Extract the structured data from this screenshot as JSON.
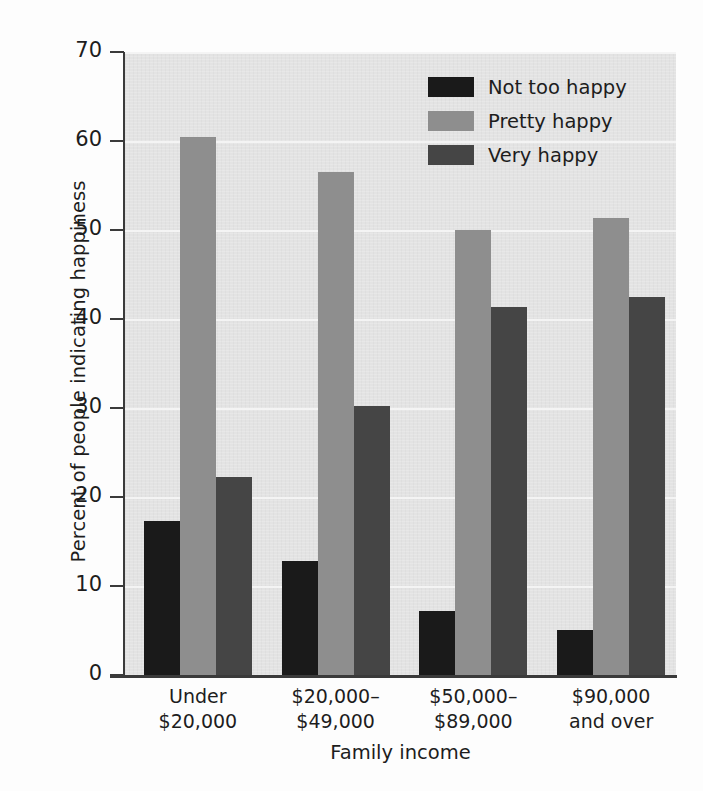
{
  "chart_data": {
    "type": "bar",
    "title": "",
    "xlabel": "Family income",
    "ylabel": "Percent of people indicating happiness",
    "categories": [
      "Under\n$20,000",
      "$20,000–\n$49,000",
      "$50,000–\n$89,000",
      "$90,000\nand over"
    ],
    "category_lines": [
      [
        "Under",
        "$20,000"
      ],
      [
        "$20,000–",
        "$49,000"
      ],
      [
        "$50,000–",
        "$89,000"
      ],
      [
        "$90,000",
        "and over"
      ]
    ],
    "series": [
      {
        "name": "Not too happy",
        "color": "#1a1a1a",
        "values": [
          17.3,
          12.8,
          7.2,
          5.1
        ]
      },
      {
        "name": "Pretty happy",
        "color": "#8e8e8e",
        "values": [
          60.4,
          56.5,
          50.0,
          51.4
        ]
      },
      {
        "name": "Very happy",
        "color": "#454545",
        "values": [
          22.2,
          30.2,
          41.4,
          42.5
        ]
      }
    ],
    "ylim": [
      0,
      70
    ],
    "yticks": [
      0,
      10,
      20,
      30,
      40,
      50,
      60,
      70
    ],
    "ytick_labels": [
      "0",
      "10",
      "20",
      "30",
      "40",
      "50",
      "60",
      "70"
    ],
    "grid": true,
    "grid_axis": "y",
    "legend_position": "upper right",
    "plot_background": "#e3e3e3",
    "gridline_color": "#f4f4f4",
    "axis_color": "#3a3a3a"
  },
  "legend": {
    "entries": [
      {
        "label": "Not too happy",
        "swatch": "legend-swatch-black"
      },
      {
        "label": "Pretty happy",
        "swatch": "legend-swatch-gray"
      },
      {
        "label": "Very happy",
        "swatch": "legend-swatch-dark-gray"
      }
    ]
  },
  "axes": {
    "y_title": "Percent of people indicating happiness",
    "x_title": "Family income"
  }
}
